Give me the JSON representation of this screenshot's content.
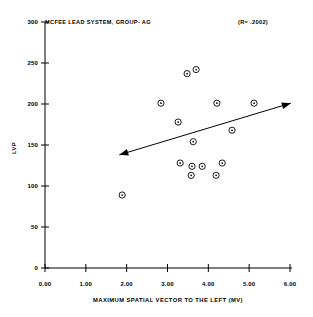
{
  "chart_data": {
    "type": "scatter",
    "title": "MCFEE LEAD SYSTEM, GROUP- AG",
    "annotation": "(R=  .2002)",
    "xlabel": "MAXIMUM SPATIAL VECTOR TO THE LEFT (MV)",
    "ylabel": "LVP",
    "xlim": [
      0.0,
      6.0
    ],
    "ylim": [
      0,
      300
    ],
    "xticks": [
      "0.00",
      "1.00",
      "2.00",
      "3.00",
      "4.00",
      "5.00",
      "6.00"
    ],
    "xtick_values": [
      0.0,
      1.0,
      2.0,
      3.0,
      4.0,
      5.0,
      6.0
    ],
    "yticks": [
      "0",
      "50",
      "100",
      "150",
      "200",
      "250",
      "300"
    ],
    "ytick_values": [
      0,
      50,
      100,
      150,
      200,
      250,
      300
    ],
    "grid": false,
    "legend": "none",
    "marker": "open-circle-with-center-dot",
    "points": [
      {
        "x": 1.89,
        "y": 89
      },
      {
        "x": 2.84,
        "y": 201
      },
      {
        "x": 3.26,
        "y": 178
      },
      {
        "x": 3.48,
        "y": 237
      },
      {
        "x": 3.7,
        "y": 242
      },
      {
        "x": 3.63,
        "y": 154
      },
      {
        "x": 3.31,
        "y": 128
      },
      {
        "x": 3.58,
        "y": 113
      },
      {
        "x": 3.6,
        "y": 124
      },
      {
        "x": 3.85,
        "y": 124
      },
      {
        "x": 4.19,
        "y": 113
      },
      {
        "x": 4.21,
        "y": 201
      },
      {
        "x": 4.34,
        "y": 128
      },
      {
        "x": 4.58,
        "y": 168
      },
      {
        "x": 5.12,
        "y": 201
      }
    ],
    "trendline": {
      "label": "regression-line",
      "x0": 1.82,
      "y0": 138,
      "x1": 6.02,
      "y1": 201,
      "arrow_start": true,
      "arrow_end": true
    },
    "colors": {
      "foreground": "#000000",
      "background": "#ffffff",
      "marker": "#000000",
      "trendline": "#000000"
    }
  }
}
